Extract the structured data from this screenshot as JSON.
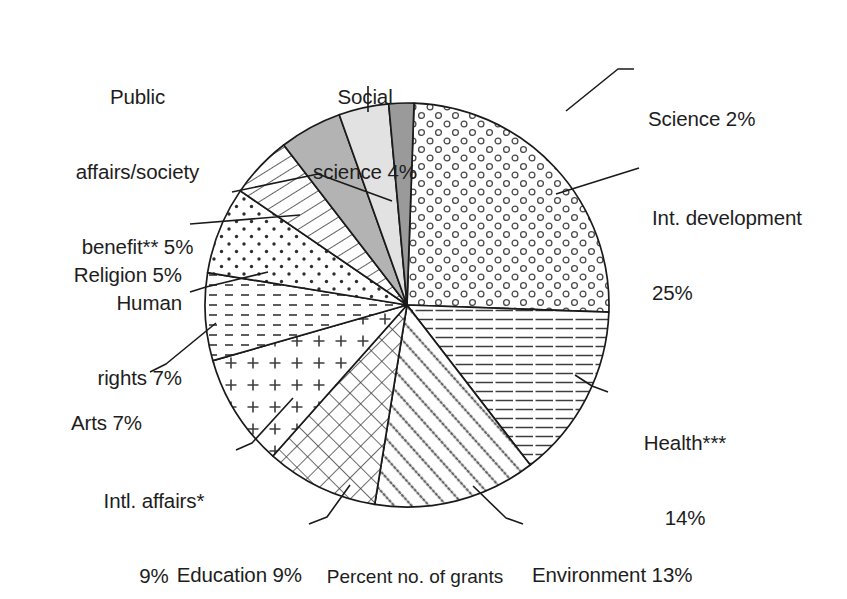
{
  "figure": {
    "caption": "Percent no. of grants",
    "type": "pie"
  },
  "chart_data": {
    "type": "pie",
    "title": "",
    "subtitle": "",
    "xlabel": "",
    "ylabel": "Percent no. of grants",
    "units": "percent",
    "legend": "none (direct labels with leader lines)",
    "grid": false,
    "start_angle_deg": -88,
    "direction": "clockwise",
    "total": 100,
    "labels": [
      "Int. development 25%",
      "Health*** 14%",
      "Environment 13%",
      "Education 9%",
      "Intl. affairs* 9%",
      "Arts 7%",
      "Human rights 7%",
      "Religion 5%",
      "Public affairs/society benefit** 5%",
      "Social science 4%",
      "Science 2%"
    ],
    "categories": [
      "Int. development",
      "Health***",
      "Environment",
      "Education",
      "Intl. affairs*",
      "Arts",
      "Human rights",
      "Religion",
      "Public affairs/society benefit**",
      "Social science",
      "Science"
    ],
    "values": [
      25,
      14,
      13,
      9,
      9,
      7,
      7,
      5,
      5,
      4,
      2
    ],
    "slices": [
      {
        "name": "Int. development",
        "value": 25,
        "pct_text": "25%",
        "fill": "open-circles",
        "color": "#ffffff"
      },
      {
        "name": "Health***",
        "value": 14,
        "pct_text": "14%",
        "fill": "horizontal-lines",
        "color": "#ffffff"
      },
      {
        "name": "Environment",
        "value": 13,
        "pct_text": "13%",
        "fill": "diagonal-dots",
        "color": "#ffffff"
      },
      {
        "name": "Education",
        "value": 9,
        "pct_text": "9%",
        "fill": "crosshatch",
        "color": "#ffffff"
      },
      {
        "name": "Intl. affairs*",
        "value": 9,
        "pct_text": "9%",
        "fill": "plus-marks",
        "color": "#ffffff"
      },
      {
        "name": "Arts",
        "value": 7,
        "pct_text": "7%",
        "fill": "dashed-lines",
        "color": "#ffffff"
      },
      {
        "name": "Human rights",
        "value": 7,
        "pct_text": "7%",
        "fill": "dots",
        "color": "#ffffff"
      },
      {
        "name": "Religion",
        "value": 5,
        "pct_text": "5%",
        "fill": "diagonal-hatch",
        "color": "#ffffff"
      },
      {
        "name": "Public affairs/society benefit**",
        "value": 5,
        "pct_text": "5%",
        "fill": "solid",
        "color": "#b3b3b3"
      },
      {
        "name": "Social science",
        "value": 4,
        "pct_text": "4%",
        "fill": "solid",
        "color": "#e2e2e2"
      },
      {
        "name": "Science",
        "value": 2,
        "pct_text": "2%",
        "fill": "solid",
        "color": "#9a9a9a"
      }
    ]
  },
  "labels": {
    "int_development": {
      "line1": "Int. development",
      "line2": "25%"
    },
    "health": {
      "line1": "Health***",
      "line2": "14%"
    },
    "environment": {
      "line1": "Environment 13%"
    },
    "education": {
      "line1": "Education 9%"
    },
    "intl_affairs": {
      "line1": "Intl. affairs*",
      "line2": "9%"
    },
    "arts": {
      "line1": "Arts 7%"
    },
    "human_rights": {
      "line1": "Human",
      "line2": "rights 7%"
    },
    "religion": {
      "line1": "Religion 5%"
    },
    "public_affairs": {
      "line1": "Public",
      "line2": "affairs/society",
      "line3": "benefit** 5%"
    },
    "social_science": {
      "line1": "Social",
      "line2": "science 4%"
    },
    "science": {
      "line1": "Science 2%"
    }
  },
  "style": {
    "stroke": "#1a1a1a",
    "background": "#ffffff"
  }
}
